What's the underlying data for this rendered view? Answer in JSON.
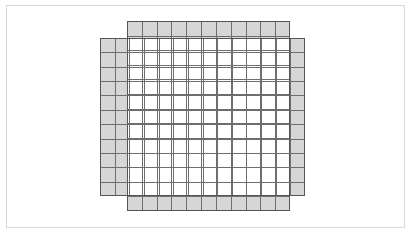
{
  "figure": {
    "title": "",
    "canvas": {
      "width": 412,
      "height": 235
    },
    "frame": {
      "name": "outer-border",
      "x": 6,
      "y": 5,
      "width": 399,
      "height": 223,
      "stroke": "#d8d8d8",
      "fill": "#ffffff"
    },
    "colors": {
      "background": "#ffffff",
      "grid_line": "#6e6e6e",
      "grid_outline": "#555555",
      "shaded_fill": "#d6d6d6",
      "overlap_fill": "#ffffff",
      "frame_stroke": "#d8d8d8"
    },
    "cell_size": 14.6,
    "grids": [
      {
        "name": "horizontal-grid",
        "orientation": "wide",
        "x": 127,
        "y": 21,
        "width": 163,
        "height": 190,
        "columns": 11,
        "rows": 13,
        "fill": "#d6d6d6"
      },
      {
        "name": "vertical-grid",
        "orientation": "tall",
        "x": 100,
        "y": 38,
        "width": 205,
        "height": 158,
        "columns": 14,
        "rows": 11,
        "fill": "#d6d6d6"
      }
    ],
    "overlap": {
      "name": "overlap-region",
      "x": 127,
      "y": 38,
      "width": 163,
      "height": 158,
      "fill": "#ffffff"
    }
  }
}
